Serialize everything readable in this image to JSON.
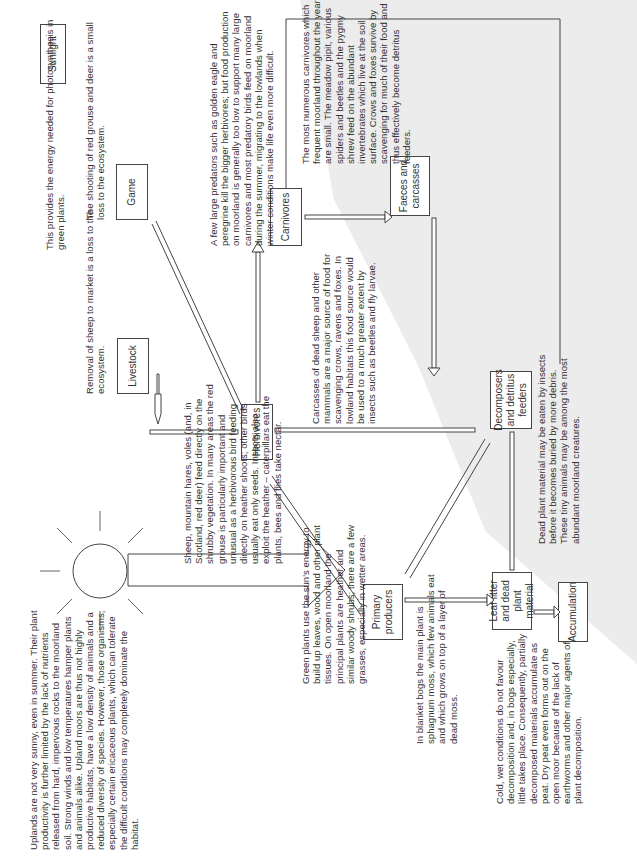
{
  "nodes": {
    "sunlight": "Sunlight",
    "primary_producers": "Primary producers",
    "herbivores": "Herbivores",
    "livestock": "Livestock",
    "game": "Game",
    "carnivores": "Carnivores",
    "faeces": "Faeces and carcasses",
    "decomposers": "Decomposers and detritus feeders",
    "leaf_litter": "Leaf litter and dead plant material",
    "accumulation": "Accumulation"
  },
  "notes": {
    "uplands": "Uplands are not very sunny, even in summer. Their plant productivity is further limited by the lack of nutrients released from hard, impervious rocks to the moorland soil. Strong winds and low temperatures hamper plants and animals alike. Upland moors are thus not highly productive habitats, have a low density of animals and a reduced diversity of species. However, those organisms, especially certain ericaceous plants, which can tolerate the difficult conditions may completely dominate the habitat.",
    "sunlight": "This provides the energy needed for photosynthesis in green plants.",
    "herbivores": "Sheep, mountain hares, voles (and, in Scotland, red deer) feed directly on the shrubby vegetation. In many areas the red grouse is particularly important and unusual as a herbivorous bird feeding directly on heather shoots; other birds usually eat only seeds. Insects also exploit the heather – caterpillars eat the plants, bees and flies take nectar.",
    "livestock": "Removal of sheep to market is a loss to the ecosystem.",
    "game": "The shooting of red grouse and deer is a small loss to the ecosystem.",
    "carnivores": "A few large predators such as golden eagle and peregrine kill the bigger herbivores; but food production on moorland is generally too low to support many large carnivores and most predatory birds feed on moorland during the summer, migrating to the lowlands when winter conditions make life even more difficult.",
    "small_carnivores": "The most numerous carnivores which frequent moorland throughout the year are small. The meadow pipit, various spiders and beetles and the pygmy shrew feed on the abundant invertebrates which live at the soil surface. Crows and foxes survive by scavenging for much of their food and thus effectively become detritus feeders.",
    "carcasses": "Carcasses of dead sheep and other mammals are a major source of food for scavenging crows, ravens and foxes. In lowland habitats this food source would be used to a much greater extent by insects such as beetles and fly larvae.",
    "green_plants": "Green plants use the sun's energy to build up leaves, wood and other plant tissues. On open moorland the principal plants are heather and similar woody shrubs; there are a few grasses, especially in wetter areas.",
    "blanket_bogs": "In blanket bogs the main plant is sphagnum moss, which few animals eat and which grows on top of a layer of dead moss.",
    "cold_wet": "Cold, wet conditions do not favour decomposition and, in bogs especially, little takes place. Consequently, partially decomposed materials accumulate as peat. Dry peat even forms out on the open moor because of the lack of earthworms and other major agents of plant decomposition.",
    "dead_plant": "Dead plant material may be eaten by insects before it becomes buried by more debris. These tiny animals may be among the most abundant moorland creatures."
  },
  "colors": {
    "line": "#444444",
    "shade": "#ececec",
    "text": "#333333"
  }
}
